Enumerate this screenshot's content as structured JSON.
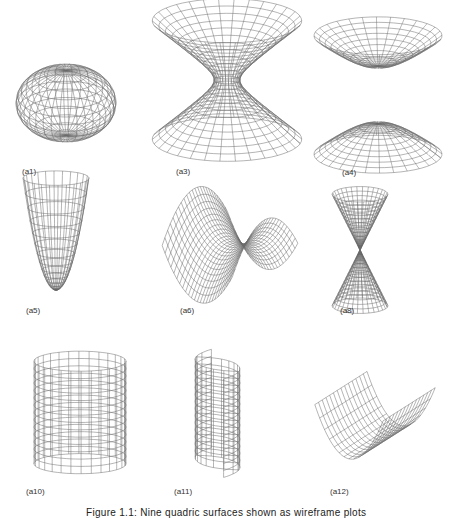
{
  "figure": {
    "caption": "Figure 1.1: Nine quadric surfaces shown as wireframe plots",
    "panels": [
      {
        "id": "a1",
        "label": "(a1)",
        "surface": "ellipsoid"
      },
      {
        "id": "a3",
        "label": "(a3)",
        "surface": "hyperboloid-of-one-sheet"
      },
      {
        "id": "a4",
        "label": "(a4)",
        "surface": "hyperboloid-of-two-sheets"
      },
      {
        "id": "a5",
        "label": "(a5)",
        "surface": "elliptic-paraboloid"
      },
      {
        "id": "a6",
        "label": "(a6)",
        "surface": "hyperbolic-paraboloid"
      },
      {
        "id": "a8",
        "label": "(a8)",
        "surface": "elliptic-cone"
      },
      {
        "id": "a10",
        "label": "(a10)",
        "surface": "elliptic-cylinder"
      },
      {
        "id": "a11",
        "label": "(a11)",
        "surface": "hyperbolic-cylinder"
      },
      {
        "id": "a12",
        "label": "(a12)",
        "surface": "parabolic-cylinder"
      }
    ]
  }
}
